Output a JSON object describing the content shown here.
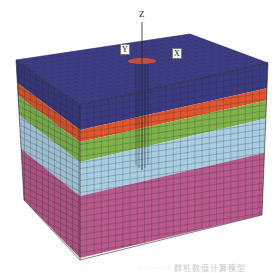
{
  "figure": {
    "axes": {
      "z_label": "Z",
      "y_label": "Y",
      "x_label": "X"
    },
    "layers": [
      {
        "name": "layer-1",
        "color": "#3b3a82"
      },
      {
        "name": "layer-2",
        "color": "#e0552e"
      },
      {
        "name": "layer-3",
        "color": "#7fb34a"
      },
      {
        "name": "layer-4",
        "color": "#a9cde0"
      },
      {
        "name": "layer-5",
        "color": "#b9588a"
      }
    ],
    "top_marker_color": "#e0552e",
    "mesh_line_color": "#1e2a33",
    "caption": "· · · · · 群桩数值计算模型"
  }
}
